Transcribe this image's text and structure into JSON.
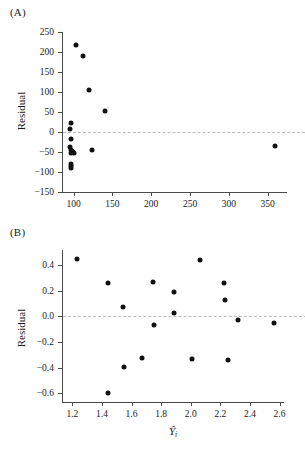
{
  "figure": {
    "panels": [
      {
        "label": "(A)",
        "ylabel": "Residual",
        "xlabel": "",
        "y_ticks": [
          "250",
          "200",
          "150",
          "100",
          "50",
          "0",
          "-50",
          "-100",
          "-150"
        ],
        "x_ticks": [
          "100",
          "150",
          "200",
          "250",
          "300",
          "350"
        ]
      },
      {
        "label": "(B)",
        "ylabel": "Residual",
        "xlabel_base": "Y",
        "xlabel_sub": "i",
        "y_ticks": [
          "0.4",
          "0.2",
          "0.0",
          "-0.2",
          "-0.4",
          "-0.6"
        ],
        "x_ticks": [
          "1.2",
          "1.4",
          "1.6",
          "1.8",
          "2.0",
          "2.2",
          "2.4",
          "2.6"
        ]
      }
    ],
    "colors": {
      "point": "#111111",
      "axis": "#4a4a4a",
      "zero_line": "#bdbdbd",
      "background": "#ffffff"
    }
  },
  "chart_data": [
    {
      "type": "scatter",
      "title": "(A)",
      "xlabel": "",
      "ylabel": "Residual",
      "xlim": [
        85,
        375
      ],
      "ylim": [
        -150,
        250
      ],
      "xticks": [
        100,
        150,
        200,
        250,
        300,
        350
      ],
      "yticks": [
        -150,
        -100,
        -50,
        0,
        50,
        100,
        150,
        200,
        250
      ],
      "grid": false,
      "legend": null,
      "reference_line": {
        "y": 0,
        "style": "dashed"
      },
      "points": [
        {
          "x": 103,
          "y": 218
        },
        {
          "x": 112,
          "y": 190
        },
        {
          "x": 120,
          "y": 106
        },
        {
          "x": 141,
          "y": 52
        },
        {
          "x": 97,
          "y": 22
        },
        {
          "x": 95,
          "y": 8
        },
        {
          "x": 96,
          "y": -17
        },
        {
          "x": 95,
          "y": -38
        },
        {
          "x": 97,
          "y": -44
        },
        {
          "x": 98,
          "y": -48
        },
        {
          "x": 99,
          "y": -50
        },
        {
          "x": 101,
          "y": -52
        },
        {
          "x": 96,
          "y": -53
        },
        {
          "x": 124,
          "y": -44
        },
        {
          "x": 96,
          "y": -80
        },
        {
          "x": 96,
          "y": -85
        },
        {
          "x": 97,
          "y": -90
        },
        {
          "x": 360,
          "y": -34
        }
      ]
    },
    {
      "type": "scatter",
      "title": "(B)",
      "xlabel": "Ŷ_i",
      "ylabel": "Residual",
      "xlim": [
        1.13,
        2.63
      ],
      "ylim": [
        -0.67,
        0.52
      ],
      "xticks": [
        1.2,
        1.4,
        1.6,
        1.8,
        2.0,
        2.2,
        2.4,
        2.6
      ],
      "yticks": [
        -0.6,
        -0.4,
        -0.2,
        0.0,
        0.2,
        0.4
      ],
      "grid": false,
      "legend": null,
      "reference_line": {
        "y": 0,
        "style": "dashed"
      },
      "points": [
        {
          "x": 1.23,
          "y": 0.45
        },
        {
          "x": 1.44,
          "y": 0.26
        },
        {
          "x": 1.545,
          "y": 0.075
        },
        {
          "x": 1.44,
          "y": -0.6
        },
        {
          "x": 1.55,
          "y": -0.395
        },
        {
          "x": 1.67,
          "y": -0.325
        },
        {
          "x": 1.745,
          "y": 0.27
        },
        {
          "x": 1.75,
          "y": -0.065
        },
        {
          "x": 1.885,
          "y": 0.19
        },
        {
          "x": 1.885,
          "y": 0.025
        },
        {
          "x": 2.005,
          "y": -0.33
        },
        {
          "x": 2.06,
          "y": 0.445
        },
        {
          "x": 2.225,
          "y": 0.265
        },
        {
          "x": 2.23,
          "y": 0.13
        },
        {
          "x": 2.25,
          "y": -0.34
        },
        {
          "x": 2.32,
          "y": -0.03
        },
        {
          "x": 2.56,
          "y": -0.055
        }
      ]
    }
  ]
}
